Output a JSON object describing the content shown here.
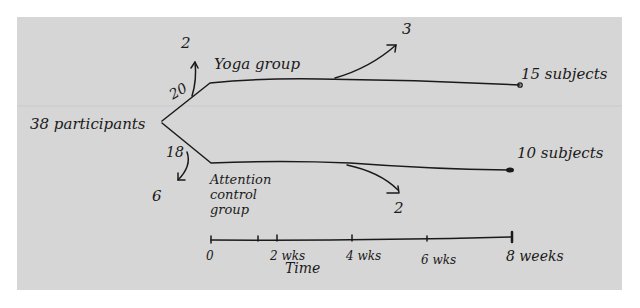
{
  "diagram": {
    "type": "participant flow diagram (hand-drawn)",
    "start": {
      "label": "38 participants"
    },
    "groups": [
      {
        "name": "Yoga group",
        "label": "Yoga group",
        "allocated": "20",
        "early_dropout": "2",
        "later_dropout": "3",
        "completed": "15 subjects"
      },
      {
        "name": "Attention control group",
        "label": "Attention\ncontrol\ngroup",
        "allocated": "18",
        "early_dropout": "6",
        "later_dropout": "2",
        "completed": "10 subjects"
      }
    ],
    "timeline": {
      "title": "Time",
      "ticks": [
        "0",
        "2 wks",
        "4 wks",
        "6 wks",
        "8 weeks"
      ]
    }
  },
  "colors": {
    "paper": "#d6d6d6",
    "ink": "#1a1a1a",
    "background": "#ffffff"
  }
}
